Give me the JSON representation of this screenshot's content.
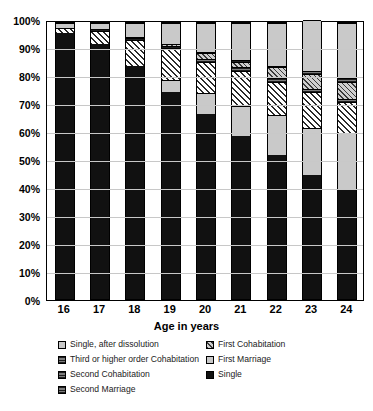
{
  "chart_data": {
    "type": "bar",
    "subtype": "100% stacked column",
    "title": "",
    "xlabel": "Age in years",
    "ylabel": "",
    "ylim": [
      0,
      100
    ],
    "yticks": [
      "0%",
      "10%",
      "20%",
      "30%",
      "40%",
      "50%",
      "60%",
      "70%",
      "80%",
      "90%",
      "100%"
    ],
    "grid": true,
    "legend_position": "bottom",
    "categories": [
      "16",
      "17",
      "18",
      "19",
      "20",
      "21",
      "22",
      "23",
      "24"
    ],
    "series": [
      {
        "name": "Single",
        "pattern": "solid-black",
        "color": "#111111",
        "values": [
          96.5,
          92.5,
          84.5,
          75.0,
          67.0,
          59.0,
          52.0,
          45.0,
          39.5
        ]
      },
      {
        "name": "First Cohabitation",
        "pattern": "light-gray",
        "color": "#c9c9c9",
        "values": [
          0.0,
          0.0,
          0.0,
          4.5,
          7.5,
          11.0,
          14.5,
          17.0,
          20.5
        ]
      },
      {
        "name": "First Marriage",
        "pattern": "diagonal-hatch",
        "color": "#ffffff",
        "values": [
          1.8,
          4.5,
          9.5,
          11.5,
          11.5,
          12.5,
          12.0,
          13.0,
          11.5
        ]
      },
      {
        "name": "Second Cohabitation",
        "pattern": "dense-gray",
        "color": "#7d7d7d",
        "values": [
          0.0,
          0.7,
          0.6,
          0.8,
          1.0,
          1.5,
          1.5,
          1.2,
          1.0
        ]
      },
      {
        "name": "Second Marriage",
        "pattern": "gray-hatch",
        "color": "#cfcfcf",
        "values": [
          0.0,
          0.0,
          0.4,
          0.5,
          2.0,
          2.0,
          4.0,
          5.5,
          6.0
        ]
      },
      {
        "name": "Third or higher order Cohabitation",
        "pattern": "dense-dark",
        "color": "#7d7d7d",
        "values": [
          0.0,
          0.0,
          0.0,
          0.0,
          0.5,
          0.5,
          0.5,
          1.0,
          1.5
        ]
      },
      {
        "name": "Single, after dissolution",
        "pattern": "light-gray",
        "color": "#c9c9c9",
        "values": [
          1.7,
          2.3,
          5.0,
          7.7,
          10.5,
          13.5,
          15.5,
          18.3,
          20.0
        ]
      }
    ]
  },
  "axis": {
    "yticks": [
      "100%",
      "90%",
      "80%",
      "70%",
      "60%",
      "50%",
      "40%",
      "30%",
      "20%",
      "10%",
      "0%"
    ],
    "xticks": [
      "16",
      "17",
      "18",
      "19",
      "20",
      "21",
      "22",
      "23",
      "24"
    ],
    "xtitle": "Age in years"
  },
  "legend": {
    "items": [
      {
        "label": "Single, after dissolution",
        "swatch": "light-gray"
      },
      {
        "label": "First Cohabitation",
        "swatch": "gray-hatch"
      },
      {
        "label": "Third or higher order Cohabitation",
        "swatch": "dense-dark"
      },
      {
        "label": "First Marriage",
        "swatch": "hatch"
      },
      {
        "label": "Second Cohabitation",
        "swatch": "dense-gray"
      },
      {
        "label": "Single",
        "swatch": "solid-black"
      },
      {
        "label": "Second Marriage",
        "swatch": "dense-gray"
      }
    ]
  }
}
